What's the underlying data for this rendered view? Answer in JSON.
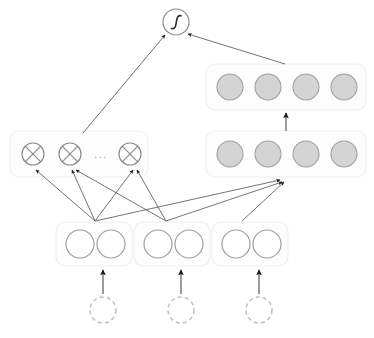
{
  "diagram": {
    "background_color": "#ffffff",
    "colors": {
      "filled_node_fill": "#d4d4d4",
      "filled_node_stroke": "#a0a0a0",
      "open_node_stroke": "#9e9e9e",
      "dashed_node_stroke": "#c2c2c2",
      "op_node_stroke": "#8c8c8c",
      "group_box_fill": "#fdfdfd",
      "group_box_stroke": "#f0f0f0",
      "edge_color": "#4a4a4a",
      "sigmoid_glyph_color": "#2a2a2a"
    },
    "output_node": {
      "label": "",
      "glyph": "sigmoid-curve",
      "cx": 176,
      "cy": 22,
      "r": 13
    },
    "multiply_layer": {
      "name": "multiplication-layer",
      "box": {
        "x": 10,
        "y": 131,
        "w": 138,
        "h": 46
      },
      "ellipsis": "...",
      "nodes": [
        {
          "glyph": "multiply-cross",
          "cx": 33,
          "cy": 154,
          "r": 11
        },
        {
          "glyph": "multiply-cross",
          "cx": 70,
          "cy": 154,
          "r": 11
        },
        {
          "glyph": "multiply-cross",
          "cx": 130,
          "cy": 154,
          "r": 11
        }
      ]
    },
    "hidden_layer_top": {
      "name": "top-feature-layer",
      "box": {
        "x": 206,
        "y": 64,
        "w": 160,
        "h": 46
      },
      "node_count": 4,
      "nodes": [
        {
          "cx": 230,
          "cy": 87,
          "r": 13
        },
        {
          "cx": 268,
          "cy": 87,
          "r": 13
        },
        {
          "cx": 306,
          "cy": 87,
          "r": 13
        },
        {
          "cx": 344,
          "cy": 87,
          "r": 13
        }
      ]
    },
    "hidden_layer_mid": {
      "name": "mid-feature-layer",
      "box": {
        "x": 206,
        "y": 131,
        "w": 160,
        "h": 46
      },
      "node_count": 4,
      "nodes": [
        {
          "cx": 230,
          "cy": 154,
          "r": 13
        },
        {
          "cx": 268,
          "cy": 154,
          "r": 13
        },
        {
          "cx": 306,
          "cy": 154,
          "r": 13
        },
        {
          "cx": 344,
          "cy": 154,
          "r": 13
        }
      ]
    },
    "input_groups": [
      {
        "name": "input-group-1",
        "box": {
          "x": 56,
          "y": 222,
          "w": 76,
          "h": 44
        },
        "nodes": [
          {
            "cx": 80,
            "cy": 244,
            "r": 14
          },
          {
            "cx": 111,
            "cy": 244,
            "r": 14
          }
        ]
      },
      {
        "name": "input-group-2",
        "box": {
          "x": 134,
          "y": 222,
          "w": 76,
          "h": 44
        },
        "nodes": [
          {
            "cx": 158,
            "cy": 244,
            "r": 14
          },
          {
            "cx": 189,
            "cy": 244,
            "r": 14
          }
        ]
      },
      {
        "name": "input-group-3",
        "box": {
          "x": 212,
          "y": 222,
          "w": 76,
          "h": 44
        },
        "nodes": [
          {
            "cx": 236,
            "cy": 244,
            "r": 14
          },
          {
            "cx": 267,
            "cy": 244,
            "r": 14
          }
        ]
      }
    ],
    "source_nodes": [
      {
        "name": "source-node-1",
        "cx": 103,
        "cy": 310,
        "r": 13
      },
      {
        "name": "source-node-2",
        "cx": 181,
        "cy": 310,
        "r": 13
      },
      {
        "name": "source-node-3",
        "cx": 259,
        "cy": 310,
        "r": 13
      }
    ],
    "edges": [
      {
        "name": "edge-source1-to-group1",
        "x1": 103,
        "y1": 294,
        "x2": 103,
        "y2": 270,
        "style": "bold"
      },
      {
        "name": "edge-source2-to-group2",
        "x1": 181,
        "y1": 294,
        "x2": 181,
        "y2": 270,
        "style": "bold"
      },
      {
        "name": "edge-source3-to-group3",
        "x1": 259,
        "y1": 294,
        "x2": 259,
        "y2": 270,
        "style": "bold"
      },
      {
        "name": "edge-fan1-to-mul1",
        "x1": 95,
        "y1": 221,
        "x2": 36,
        "y2": 170,
        "style": "thin"
      },
      {
        "name": "edge-fan1-to-mul2",
        "x1": 95,
        "y1": 221,
        "x2": 72,
        "y2": 170,
        "style": "thin"
      },
      {
        "name": "edge-fan1-to-mul3",
        "x1": 95,
        "y1": 221,
        "x2": 133,
        "y2": 170,
        "style": "thin"
      },
      {
        "name": "edge-fan1-to-mid-layer",
        "x1": 95,
        "y1": 221,
        "x2": 280,
        "y2": 180,
        "style": "thin"
      },
      {
        "name": "edge-fan2-to-mul2",
        "x1": 166,
        "y1": 221,
        "x2": 76,
        "y2": 170,
        "style": "thin"
      },
      {
        "name": "edge-fan2-to-mul3",
        "x1": 166,
        "y1": 221,
        "x2": 137,
        "y2": 170,
        "style": "thin"
      },
      {
        "name": "edge-fan2-to-mid-layer",
        "x1": 166,
        "y1": 221,
        "x2": 282,
        "y2": 182,
        "style": "thin"
      },
      {
        "name": "edge-fan3-to-mid-layer",
        "x1": 242,
        "y1": 221,
        "x2": 284,
        "y2": 182,
        "style": "thin"
      },
      {
        "name": "edge-mid-layer-to-top-layer",
        "x1": 286,
        "y1": 131,
        "x2": 286,
        "y2": 113,
        "style": "bold"
      },
      {
        "name": "edge-multiply-to-output",
        "x1": 83,
        "y1": 133,
        "x2": 165,
        "y2": 35,
        "style": "thin"
      },
      {
        "name": "edge-top-layer-to-output",
        "x1": 285,
        "y1": 64,
        "x2": 188,
        "y2": 34,
        "style": "thin"
      }
    ]
  }
}
